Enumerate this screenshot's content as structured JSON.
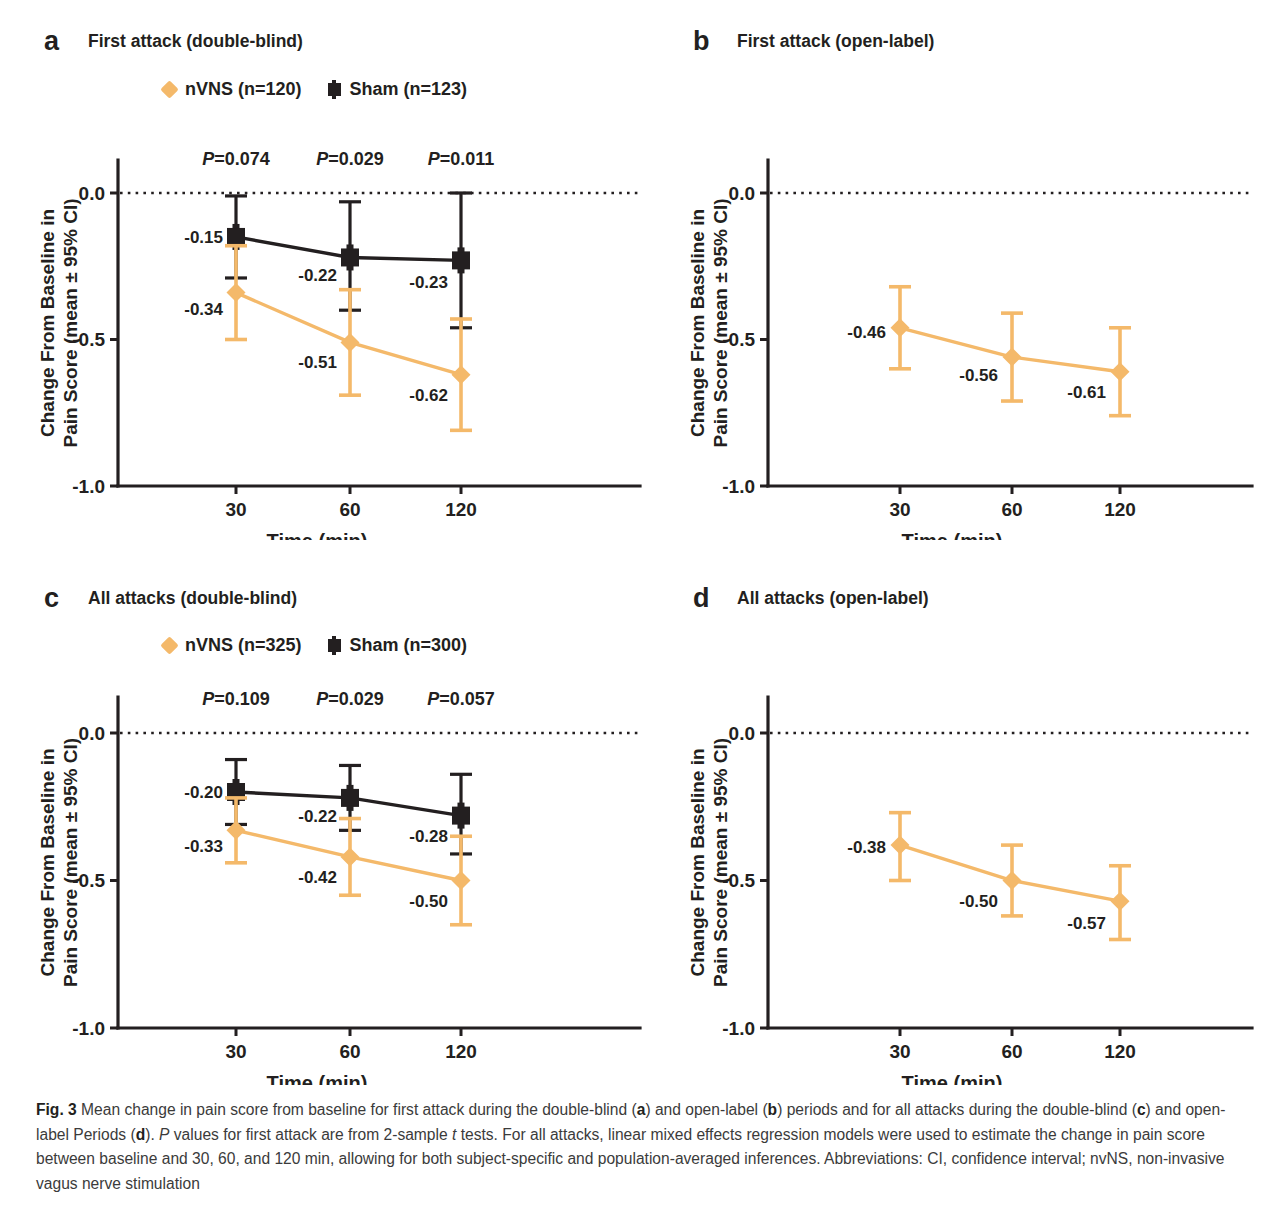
{
  "figure": {
    "label": "Fig. 3",
    "caption_text": " Mean change in pain score from baseline for first attack during the double-blind (a) and open-label (b) periods and for all attacks during the double-blind (c) and open-label Periods (d). P values for first attack are from 2-sample t tests. For all attacks, linear mixed effects regression models were used to estimate the change in pain score between baseline and 30, 60, and 120 min, allowing for both subject-specific and population-averaged inferences. Abbreviations: CI, confidence interval; nvNS, non-invasive vagus nerve stimulation"
  },
  "colors": {
    "nvns": "#f4b96a",
    "sham": "#231f20",
    "text": "#231f20"
  },
  "axis": {
    "y_title_line1": "Change From Baseline in",
    "y_title_line2": "Pain Score (mean ± 95% CI)",
    "x_title": "Time (min)",
    "y_ticks": [
      "0.0",
      "-0.5",
      "-1.0"
    ],
    "x_ticks": [
      "30",
      "60",
      "120"
    ]
  },
  "panels": [
    {
      "letter": "a",
      "title": "First attack (double-blind)",
      "has_legend": true,
      "has_sham": true,
      "legend": [
        {
          "marker": "diamond",
          "label": "nVNS (n=120)"
        },
        {
          "marker": "square",
          "label": "Sham (n=123)"
        }
      ],
      "pvalues": [
        "P=0.074",
        "P=0.029",
        "P=0.011"
      ]
    },
    {
      "letter": "b",
      "title": "First attack (open-label)",
      "has_legend": false,
      "has_sham": false,
      "legend": [],
      "pvalues": []
    },
    {
      "letter": "c",
      "title": "All attacks (double-blind)",
      "has_legend": true,
      "has_sham": true,
      "legend": [
        {
          "marker": "diamond",
          "label": "nVNS (n=325)"
        },
        {
          "marker": "square",
          "label": "Sham (n=300)"
        }
      ],
      "pvalues": [
        "P=0.109",
        "P=0.029",
        "P=0.057"
      ]
    },
    {
      "letter": "d",
      "title": "All attacks (open-label)",
      "has_legend": false,
      "has_sham": false,
      "legend": [],
      "pvalues": []
    }
  ],
  "chart_data": [
    {
      "panel": "a",
      "type": "line",
      "title": "First attack (double-blind)",
      "xlabel": "Time (min)",
      "ylabel": "Change From Baseline in Pain Score (mean ± 95% CI)",
      "x": [
        30,
        60,
        120
      ],
      "categories": [
        "30",
        "60",
        "120"
      ],
      "ylim": [
        -1.0,
        0.0
      ],
      "yticks": [
        0.0,
        -0.5,
        -1.0
      ],
      "grid": false,
      "zero_reference_line": 0.0,
      "legend_position": "top",
      "annotations": [
        "P=0.074",
        "P=0.029",
        "P=0.011"
      ],
      "series": [
        {
          "name": "nVNS (n=120)",
          "color": "#f4b96a",
          "marker": "diamond",
          "values": [
            -0.34,
            -0.51,
            -0.62
          ],
          "labels": [
            "-0.34",
            "-0.51",
            "-0.62"
          ],
          "ci_lower": [
            -0.5,
            -0.69,
            -0.81
          ],
          "ci_upper": [
            -0.18,
            -0.33,
            -0.43
          ]
        },
        {
          "name": "Sham (n=123)",
          "color": "#231f20",
          "marker": "square",
          "values": [
            -0.15,
            -0.22,
            -0.23
          ],
          "labels": [
            "-0.15",
            "-0.22",
            "-0.23"
          ],
          "ci_lower": [
            -0.29,
            -0.4,
            -0.46
          ],
          "ci_upper": [
            -0.01,
            -0.03,
            0.0
          ]
        }
      ]
    },
    {
      "panel": "b",
      "type": "line",
      "title": "First attack (open-label)",
      "xlabel": "Time (min)",
      "ylabel": "Change From Baseline in Pain Score (mean ± 95% CI)",
      "x": [
        30,
        60,
        120
      ],
      "categories": [
        "30",
        "60",
        "120"
      ],
      "ylim": [
        -1.0,
        0.0
      ],
      "yticks": [
        0.0,
        -0.5,
        -1.0
      ],
      "grid": false,
      "zero_reference_line": 0.0,
      "legend_position": "none",
      "annotations": [],
      "series": [
        {
          "name": "nVNS",
          "color": "#f4b96a",
          "marker": "diamond",
          "values": [
            -0.46,
            -0.56,
            -0.61
          ],
          "labels": [
            "-0.46",
            "-0.56",
            "-0.61"
          ],
          "ci_lower": [
            -0.6,
            -0.71,
            -0.76
          ],
          "ci_upper": [
            -0.32,
            -0.41,
            -0.46
          ]
        }
      ]
    },
    {
      "panel": "c",
      "type": "line",
      "title": "All attacks (double-blind)",
      "xlabel": "Time (min)",
      "ylabel": "Change From Baseline in Pain Score (mean ± 95% CI)",
      "x": [
        30,
        60,
        120
      ],
      "categories": [
        "30",
        "60",
        "120"
      ],
      "ylim": [
        -1.0,
        0.0
      ],
      "yticks": [
        0.0,
        -0.5,
        -1.0
      ],
      "grid": false,
      "zero_reference_line": 0.0,
      "legend_position": "top",
      "annotations": [
        "P=0.109",
        "P=0.029",
        "P=0.057"
      ],
      "series": [
        {
          "name": "nVNS (n=325)",
          "color": "#f4b96a",
          "marker": "diamond",
          "values": [
            -0.33,
            -0.42,
            -0.5
          ],
          "labels": [
            "-0.33",
            "-0.42",
            "-0.50"
          ],
          "ci_lower": [
            -0.44,
            -0.55,
            -0.65
          ],
          "ci_upper": [
            -0.22,
            -0.29,
            -0.35
          ]
        },
        {
          "name": "Sham (n=300)",
          "color": "#231f20",
          "marker": "square",
          "values": [
            -0.2,
            -0.22,
            -0.28
          ],
          "labels": [
            "-0.20",
            "-0.22",
            "-0.28"
          ],
          "ci_lower": [
            -0.31,
            -0.33,
            -0.41
          ],
          "ci_upper": [
            -0.09,
            -0.11,
            -0.14
          ]
        }
      ]
    },
    {
      "panel": "d",
      "type": "line",
      "title": "All attacks (open-label)",
      "xlabel": "Time (min)",
      "ylabel": "Change From Baseline in Pain Score (mean ± 95% CI)",
      "x": [
        30,
        60,
        120
      ],
      "categories": [
        "30",
        "60",
        "120"
      ],
      "ylim": [
        -1.0,
        0.0
      ],
      "yticks": [
        0.0,
        -0.5,
        -1.0
      ],
      "grid": false,
      "zero_reference_line": 0.0,
      "legend_position": "none",
      "annotations": [],
      "series": [
        {
          "name": "nVNS",
          "color": "#f4b96a",
          "marker": "diamond",
          "values": [
            -0.38,
            -0.5,
            -0.57
          ],
          "labels": [
            "-0.38",
            "-0.50",
            "-0.57"
          ],
          "ci_lower": [
            -0.5,
            -0.62,
            -0.7
          ],
          "ci_upper": [
            -0.27,
            -0.38,
            -0.45
          ]
        }
      ]
    }
  ]
}
